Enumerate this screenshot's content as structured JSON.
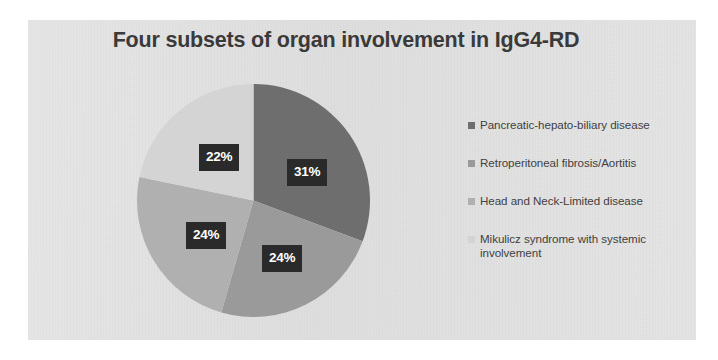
{
  "figure": {
    "background_color": "#ffffff",
    "panel_color": "#e2e2e2"
  },
  "chart_data": {
    "type": "pie",
    "title": "Four subsets of organ involvement in IgG4-RD",
    "subtitle": "",
    "xlabel": "",
    "ylabel": "",
    "legend_position": "right",
    "grid": false,
    "categories": [
      "Pancreatic-hepato-biliary disease",
      "Retroperitoneal fibrosis/Aortitis",
      "Head and Neck-Limited disease",
      "Mikulicz syndrome with systemic involvement"
    ],
    "values": [
      31,
      24,
      24,
      22
    ],
    "data_labels": [
      "31%",
      "24%",
      "24%",
      "22%"
    ],
    "colors": [
      "#6e6e6e",
      "#9a9a9a",
      "#b0b0b0",
      "#d4d4d4"
    ],
    "units": "percent",
    "start_angle_deg": 0,
    "direction": "clockwise",
    "label_text_color": "#ffffff",
    "label_box_color": "#2a2a2a"
  },
  "legend": {
    "items": [
      {
        "label": "Pancreatic-hepato-biliary disease",
        "color": "#6e6e6e"
      },
      {
        "label": "Retroperitoneal fibrosis/Aortitis",
        "color": "#9a9a9a"
      },
      {
        "label": "Head and Neck-Limited disease",
        "color": "#b0b0b0"
      },
      {
        "label": "Mikulicz syndrome with systemic involvement",
        "color": "#d4d4d4"
      }
    ]
  }
}
